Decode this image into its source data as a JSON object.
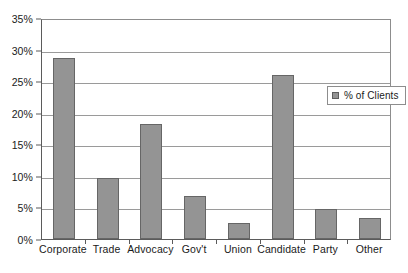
{
  "chart_data": {
    "type": "bar",
    "title": "",
    "subtitle": "",
    "xlabel": "",
    "ylabel": "",
    "categories": [
      "Corporate",
      "Trade",
      "Advocacy",
      "Gov't",
      "Union",
      "Candidate",
      "Party",
      "Other"
    ],
    "values": [
      28.7,
      9.7,
      18.2,
      6.8,
      2.5,
      25.9,
      4.8,
      3.3
    ],
    "series": [
      {
        "name": "% of Clients",
        "values": [
          28.7,
          9.7,
          18.2,
          6.8,
          2.5,
          25.9,
          4.8,
          3.3
        ]
      }
    ],
    "ylim": [
      0,
      35
    ],
    "ytick_values": [
      0,
      5,
      10,
      15,
      20,
      25,
      30,
      35
    ],
    "ytick_labels": [
      "0%",
      "5%",
      "10%",
      "15%",
      "20%",
      "25%",
      "30%",
      "35%"
    ],
    "grid": true,
    "grid_axis": "y",
    "legend": {
      "position": "inside-right",
      "entries": [
        "% of Clients"
      ]
    },
    "colors": {
      "bar_fill": "#949494",
      "bar_border": "#666666",
      "gridline": "#9a9a9a",
      "axis": "#5b5b5b",
      "plot_border": "#8d8d8d",
      "text": "#1a1a1a",
      "background": "#ffffff"
    }
  },
  "legend": {
    "label": "% of Clients",
    "swatch_name": "legend-swatch-percent-of-clients"
  }
}
